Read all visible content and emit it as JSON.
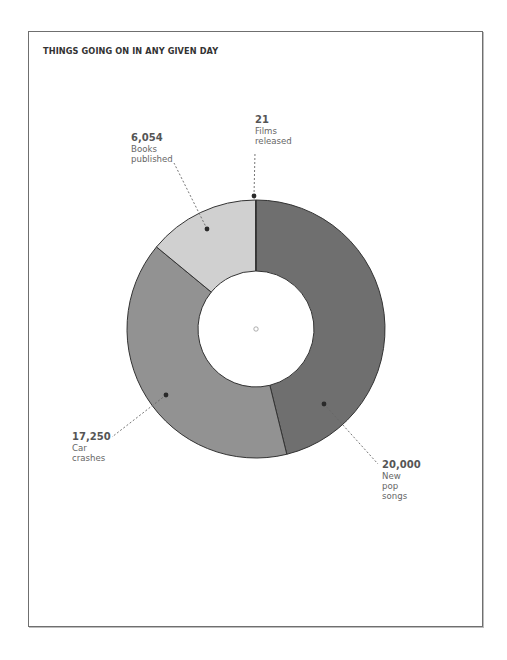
{
  "chart_data": {
    "type": "pie",
    "subtype": "donut",
    "title": "THINGS GOING ON IN ANY GIVEN DAY",
    "categories": [
      "New pop songs",
      "Car crashes",
      "Books published",
      "Films released"
    ],
    "values": [
      20000,
      17250,
      6054,
      21
    ],
    "colors": [
      "#6f6f6f",
      "#929292",
      "#d0d0d0",
      "#555555"
    ],
    "start_angle_deg": 0,
    "direction": "clockwise",
    "legend": "none (direct labels)"
  },
  "title": "THINGS GOING ON IN ANY GIVEN DAY",
  "labels": {
    "films": {
      "value": "21",
      "text": "Films\nreleased"
    },
    "books": {
      "value": "6,054",
      "text": "Books\npublished"
    },
    "cars": {
      "value": "17,250",
      "text": "Car\ncrashes"
    },
    "pop": {
      "value": "20,000",
      "text": "New\npop\nsongs"
    }
  },
  "style": {
    "stroke": "#333333",
    "frame": "#6f6f6f"
  }
}
